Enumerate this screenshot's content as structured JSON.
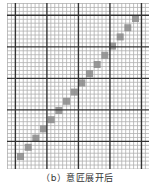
{
  "figure": {
    "caption": "（b）意匠展开后",
    "grid": {
      "cols": 36,
      "rows": 42,
      "cell_px": 3.94,
      "major_every": 8,
      "minor_color": "#b0b0b0",
      "major_color": "#333333"
    },
    "diagonal": {
      "count": 16,
      "square_px": 7,
      "start": [
        10,
        150
      ],
      "end": [
        125,
        12
      ],
      "fill": "#8a8a8a"
    }
  }
}
